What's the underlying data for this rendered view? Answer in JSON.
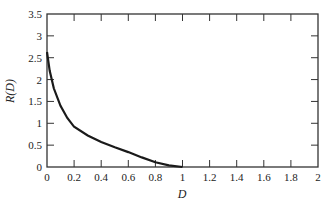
{
  "chart_data": {
    "type": "line",
    "title": "",
    "xlabel": "D",
    "ylabel": "R(D)",
    "xlim": [
      0,
      2
    ],
    "ylim": [
      0,
      3.5
    ],
    "grid": false,
    "legend": null,
    "x_ticks": [
      "0",
      "0.2",
      "0.4",
      "0.6",
      "0.8",
      "1",
      "1.2",
      "1.4",
      "1.6",
      "1.8",
      "2"
    ],
    "y_ticks": [
      "0",
      "0.5",
      "1",
      "1.5",
      "2",
      "2.5",
      "3",
      "3.5"
    ],
    "series": [
      {
        "name": "R(D)",
        "x": [
          0,
          0.02,
          0.05,
          0.1,
          0.15,
          0.2,
          0.3,
          0.4,
          0.5,
          0.6,
          0.7,
          0.8,
          0.9,
          1.0
        ],
        "y": [
          2.63,
          2.2,
          1.8,
          1.4,
          1.12,
          0.92,
          0.72,
          0.57,
          0.45,
          0.34,
          0.22,
          0.11,
          0.04,
          0
        ]
      }
    ]
  }
}
